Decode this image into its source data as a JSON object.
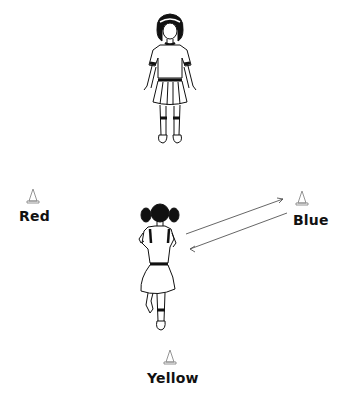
{
  "diagram": {
    "cones": [
      {
        "id": "red",
        "label": "Red"
      },
      {
        "id": "blue",
        "label": "Blue"
      },
      {
        "id": "yellow",
        "label": "Yellow"
      }
    ],
    "figures": [
      {
        "id": "coach",
        "description": "girl standing facing forward"
      },
      {
        "id": "runner",
        "description": "girl running, seen from behind"
      }
    ],
    "arrows": [
      {
        "from": "runner",
        "to": "blue",
        "direction": "out"
      },
      {
        "from": "blue",
        "to": "runner",
        "direction": "back"
      }
    ],
    "colors": {
      "line": "#111111",
      "background": "#ffffff"
    }
  }
}
